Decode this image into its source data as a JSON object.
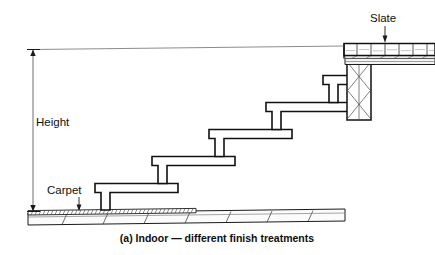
{
  "figure": {
    "caption": "(a) Indoor — different finish treatments",
    "labels": {
      "height": "Height",
      "carpet": "Carpet",
      "slate": "Slate"
    },
    "colors": {
      "ink": "#101010",
      "line": "#1a1a1a",
      "hatch": "#4a4a4a",
      "thin": "#555555",
      "paper": "#ffffff",
      "fill": "#fdfdfd"
    },
    "annotations": [
      {
        "name": "height-dimension",
        "text": "Height",
        "kind": "vertical-dimension-arrow"
      },
      {
        "name": "carpet-callout",
        "text": "Carpet",
        "kind": "leader-arrow-down"
      },
      {
        "name": "slate-callout",
        "text": "Slate",
        "kind": "leader-arrow-down"
      }
    ],
    "geometry": {
      "floor_y": 213,
      "top_dim_y": 49,
      "dim_x": 33,
      "steps": 5,
      "landing_label": "slate-landing",
      "column_hatch": "cross-hatch"
    }
  }
}
